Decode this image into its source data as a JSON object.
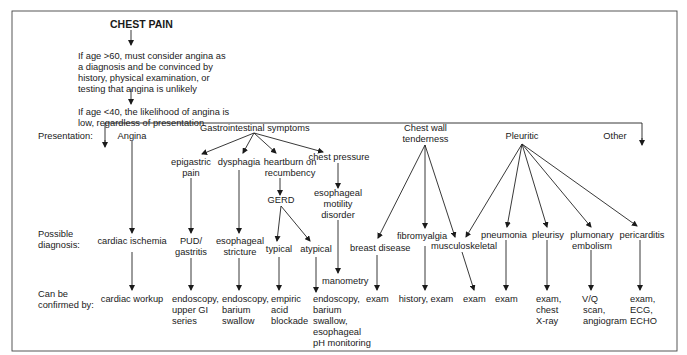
{
  "title": "CHEST PAIN",
  "preamble": {
    "age_over_60": [
      "If age >60, must consider angina as",
      "a diagnosis and be convinced by",
      "history, physical examination, or",
      "testing that angina is unlikely"
    ],
    "age_under_40": [
      "If age <40, the likelihood of angina is",
      "low, regardless of presentation"
    ]
  },
  "row_labels": {
    "presentation": "Presentation:",
    "possible_diagnosis": [
      "Possible",
      "diagnosis:"
    ],
    "confirmed_by": [
      "Can be",
      "confirmed by:"
    ]
  },
  "presentations": {
    "angina": "Angina",
    "gi": "Gastrointestinal symptoms",
    "chest_wall": [
      "Chest wall",
      "tenderness"
    ],
    "pleuritic": "Pleuritic",
    "other": "Other"
  },
  "gi_symptoms": {
    "epigastric": [
      "epigastric",
      "pain"
    ],
    "dysphagia": "dysphagia",
    "heartburn": [
      "heartburn on",
      "recumbency"
    ],
    "chest_pressure": "chest pressure",
    "gerd": "GERD",
    "motility": [
      "esophageal",
      "motility",
      "disorder"
    ]
  },
  "diagnoses": {
    "cardiac_ischemia": "cardiac ischemia",
    "pud": [
      "PUD/",
      "gastritis"
    ],
    "stricture": [
      "esophageal",
      "stricture"
    ],
    "typical": "typical",
    "atypical": "atypical",
    "manometry": "manometry",
    "breast": "breast disease",
    "fibromyalgia": "fibromyalgia",
    "musculoskeletal": "musculoskeletal",
    "pneumonia": "pneumonia",
    "pleurisy": "pleurisy",
    "embolism": [
      "plumonary",
      "embolism"
    ],
    "pericarditis": "pericarditis"
  },
  "confirmations": {
    "cardiac": "cardiac workup",
    "pud": [
      "endoscopy,",
      "upper GI",
      "series"
    ],
    "stricture": [
      "endoscopy,",
      "barium",
      "swallow"
    ],
    "typical": [
      "empiric",
      "acid",
      "blockade"
    ],
    "atypical": [
      "endoscopy,",
      "barium",
      "swallow,",
      "esophageal",
      "pH monitoring"
    ],
    "breast": "exam",
    "fibromyalgia": "history, exam",
    "musculoskeletal": "exam",
    "pneumonia": "exam",
    "pleurisy": [
      "exam,",
      "chest",
      "X-ray"
    ],
    "embolism": [
      "V/Q",
      "scan,",
      "angiogram"
    ],
    "pericarditis": [
      "exam,",
      "ECG,",
      "ECHO"
    ]
  }
}
